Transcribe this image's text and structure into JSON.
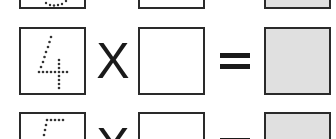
{
  "worksheet": {
    "rows": [
      {
        "digit": "3",
        "operator": "X",
        "equals": "=",
        "answer": "",
        "result": ""
      },
      {
        "digit": "4",
        "operator": "X",
        "equals": "=",
        "answer": "",
        "result": ""
      },
      {
        "digit": "5",
        "operator": "X",
        "equals": "=",
        "answer": "",
        "result": ""
      }
    ],
    "colors": {
      "border": "#2a2a2a",
      "result_fill": "#e0e0e0",
      "dot": "#333333"
    }
  }
}
